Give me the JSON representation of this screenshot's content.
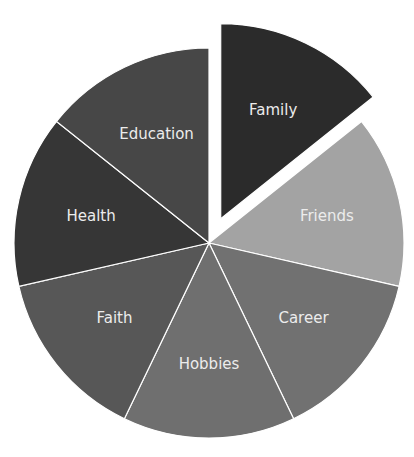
{
  "chart_data": {
    "type": "pie",
    "title": "",
    "categories": [
      "Family",
      "Friends",
      "Career",
      "Hobbies",
      "Faith",
      "Health",
      "Education"
    ],
    "values": [
      14.29,
      14.29,
      14.29,
      14.29,
      14.29,
      14.29,
      14.29
    ],
    "colors": [
      "#2b2b2b",
      "#a3a3a3",
      "#717171",
      "#6f6f6f",
      "#575757",
      "#363636",
      "#474747"
    ],
    "exploded": [
      "Family"
    ],
    "start_angle_deg": -90,
    "direction": "clockwise",
    "legend": "none",
    "labels_inside": true
  },
  "layout": {
    "cx": 209,
    "cy": 243,
    "r": 195,
    "explode_offset": 27,
    "label_radius_frac": 0.62
  },
  "slices": [
    {
      "label": "Family",
      "color": "#2b2b2b",
      "exploded": true
    },
    {
      "label": "Friends",
      "color": "#a3a3a3",
      "exploded": false
    },
    {
      "label": "Career",
      "color": "#717171",
      "exploded": false
    },
    {
      "label": "Hobbies",
      "color": "#6f6f6f",
      "exploded": false
    },
    {
      "label": "Faith",
      "color": "#575757",
      "exploded": false
    },
    {
      "label": "Health",
      "color": "#363636",
      "exploded": false
    },
    {
      "label": "Education",
      "color": "#474747",
      "exploded": false
    }
  ]
}
